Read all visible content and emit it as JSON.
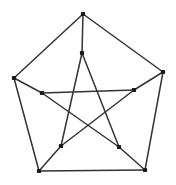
{
  "figure": {
    "width": 176,
    "height": 185,
    "background_color": "#ffffff",
    "line_color": "#333333",
    "vertex_color": "#1a1a1a",
    "line_width": 1.5,
    "vertex_size": 4.2
  },
  "graph": {
    "vertices": [
      {
        "id": "outer-top",
        "ring": "outer",
        "index": 0,
        "x": 83,
        "y": 14
      },
      {
        "id": "outer-right",
        "ring": "outer",
        "index": 1,
        "x": 163,
        "y": 72
      },
      {
        "id": "outer-bottom-right",
        "ring": "outer",
        "index": 2,
        "x": 145,
        "y": 170
      },
      {
        "id": "outer-bottom-left",
        "ring": "outer",
        "index": 3,
        "x": 39,
        "y": 171
      },
      {
        "id": "outer-left",
        "ring": "outer",
        "index": 4,
        "x": 14,
        "y": 78
      },
      {
        "id": "inner-top",
        "ring": "inner",
        "index": 0,
        "x": 82,
        "y": 53
      },
      {
        "id": "inner-right",
        "ring": "inner",
        "index": 1,
        "x": 134,
        "y": 90
      },
      {
        "id": "inner-bottom-right",
        "ring": "inner",
        "index": 2,
        "x": 119,
        "y": 147
      },
      {
        "id": "inner-bottom-left",
        "ring": "inner",
        "index": 3,
        "x": 61,
        "y": 146
      },
      {
        "id": "inner-left",
        "ring": "inner",
        "index": 4,
        "x": 42,
        "y": 93
      }
    ],
    "edges": [
      {
        "id": "pentagon-top-right",
        "group": "outer-pentagon",
        "from": "outer-top",
        "to": "outer-right",
        "x1": 83,
        "y1": 14,
        "x2": 163,
        "y2": 72
      },
      {
        "id": "pentagon-right-bottomright",
        "group": "outer-pentagon",
        "from": "outer-right",
        "to": "outer-bottom-right",
        "x1": 163,
        "y1": 72,
        "x2": 145,
        "y2": 170
      },
      {
        "id": "pentagon-bottomright-bottomleft",
        "group": "outer-pentagon",
        "from": "outer-bottom-right",
        "to": "outer-bottom-left",
        "x1": 145,
        "y1": 170,
        "x2": 39,
        "y2": 171
      },
      {
        "id": "pentagon-bottomleft-left",
        "group": "outer-pentagon",
        "from": "outer-bottom-left",
        "to": "outer-left",
        "x1": 39,
        "y1": 171,
        "x2": 14,
        "y2": 78
      },
      {
        "id": "pentagon-left-top",
        "group": "outer-pentagon",
        "from": "outer-left",
        "to": "outer-top",
        "x1": 14,
        "y1": 78,
        "x2": 83,
        "y2": 14
      },
      {
        "id": "spoke-top",
        "group": "spokes",
        "from": "outer-top",
        "to": "inner-top",
        "x1": 83,
        "y1": 14,
        "x2": 82,
        "y2": 53
      },
      {
        "id": "spoke-right",
        "group": "spokes",
        "from": "outer-right",
        "to": "inner-right",
        "x1": 163,
        "y1": 72,
        "x2": 134,
        "y2": 90
      },
      {
        "id": "spoke-bottom-right",
        "group": "spokes",
        "from": "outer-bottom-right",
        "to": "inner-bottom-right",
        "x1": 145,
        "y1": 170,
        "x2": 119,
        "y2": 147
      },
      {
        "id": "spoke-bottom-left",
        "group": "spokes",
        "from": "outer-bottom-left",
        "to": "inner-bottom-left",
        "x1": 39,
        "y1": 171,
        "x2": 61,
        "y2": 146
      },
      {
        "id": "spoke-left",
        "group": "spokes",
        "from": "outer-left",
        "to": "inner-left",
        "x1": 14,
        "y1": 78,
        "x2": 42,
        "y2": 93
      },
      {
        "id": "star-top-bottomright",
        "group": "inner-pentagram",
        "from": "inner-top",
        "to": "inner-bottom-right",
        "x1": 82,
        "y1": 53,
        "x2": 119,
        "y2": 147
      },
      {
        "id": "star-bottomright-left",
        "group": "inner-pentagram",
        "from": "inner-bottom-right",
        "to": "inner-left",
        "x1": 119,
        "y1": 147,
        "x2": 42,
        "y2": 93
      },
      {
        "id": "star-left-right",
        "group": "inner-pentagram",
        "from": "inner-left",
        "to": "inner-right",
        "x1": 42,
        "y1": 93,
        "x2": 134,
        "y2": 90
      },
      {
        "id": "star-right-bottomleft",
        "group": "inner-pentagram",
        "from": "inner-right",
        "to": "inner-bottom-left",
        "x1": 134,
        "y1": 90,
        "x2": 61,
        "y2": 146
      },
      {
        "id": "star-bottomleft-top",
        "group": "inner-pentagram",
        "from": "inner-bottom-left",
        "to": "inner-top",
        "x1": 61,
        "y1": 146,
        "x2": 82,
        "y2": 53
      }
    ]
  }
}
